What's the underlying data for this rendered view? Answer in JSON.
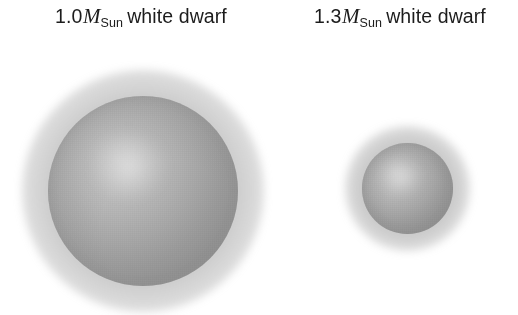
{
  "figure": {
    "background_color": "#ffffff",
    "width": 518,
    "height": 315
  },
  "panels": [
    {
      "id": "left",
      "label": {
        "mass_value": "1.0",
        "mass_symbol": "M",
        "mass_subscript": "Sun",
        "object_text": "white dwarf",
        "full_text": "1.0MSun white dwarf",
        "color": "#1c1c1c"
      },
      "sphere": {
        "name": "white-dwarf-large",
        "center_x": 143,
        "center_y": 191,
        "diameter_px": 190,
        "radius_px": 95,
        "highlight_color": "#cfcfcf",
        "midtone_color": "#a9a9a9",
        "limb_color": "#8a8a8a",
        "glow_color": "#808080"
      }
    },
    {
      "id": "right",
      "label": {
        "mass_value": "1.3",
        "mass_symbol": "M",
        "mass_subscript": "Sun",
        "object_text": "white dwarf",
        "full_text": "1.3MSun white dwarf",
        "color": "#1c1c1c"
      },
      "sphere": {
        "name": "white-dwarf-small",
        "center_x": 407,
        "center_y": 188,
        "diameter_px": 91,
        "radius_px": 45,
        "highlight_color": "#cfcfcf",
        "midtone_color": "#a9a9a9",
        "limb_color": "#8a8a8a",
        "glow_color": "#808080"
      }
    }
  ]
}
